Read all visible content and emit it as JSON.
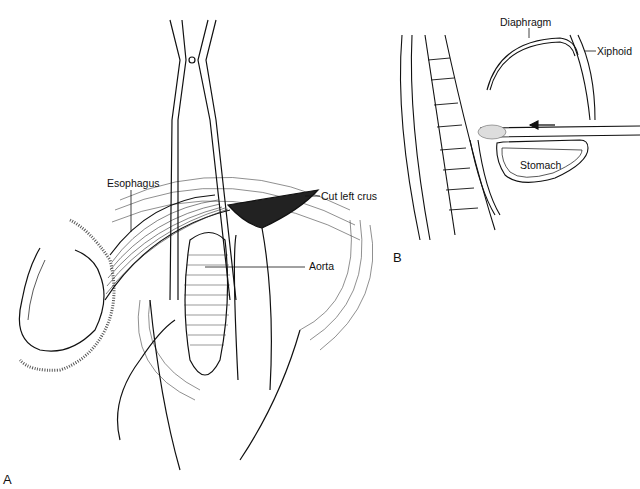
{
  "figure": {
    "panel_a": {
      "letter": "A",
      "labels": {
        "esophagus": "Esophagus",
        "cut_left_crus": "Cut left crus",
        "aorta": "Aorta"
      }
    },
    "panel_b": {
      "letter": "B",
      "labels": {
        "diaphragm": "Diaphragm",
        "xiphoid": "Xiphoid",
        "stomach": "Stomach"
      }
    }
  }
}
